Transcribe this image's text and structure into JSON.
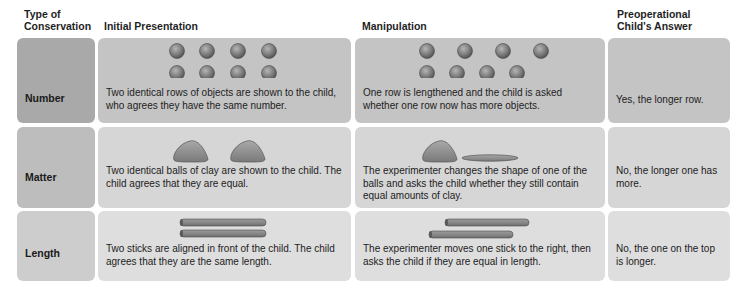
{
  "headers": {
    "type": [
      "Type of",
      "Conservation"
    ],
    "initial": "Initial Presentation",
    "manipulation": "Manipulation",
    "answer": [
      "Preoperational",
      "Child's Answer"
    ]
  },
  "rows": [
    {
      "type": "Number",
      "initial": "Two identical rows of objects are shown to the child, who agrees they have the same number.",
      "manipulation": "One row is lengthened and the child is asked whether one row now has more objects.",
      "answer": "Yes, the longer row.",
      "initial_illustration": "two-rows-of-four-balls-icon",
      "manipulation_illustration": "lengthened-row-of-balls-icon"
    },
    {
      "type": "Matter",
      "initial": "Two identical balls of clay are shown to the child. The child agrees that they are equal.",
      "manipulation": "The experimenter changes the shape of one of the balls and asks the child whether they still contain equal amounts of clay.",
      "answer": "No, the longer one has more.",
      "initial_illustration": "two-clay-balls-icon",
      "manipulation_illustration": "clay-ball-and-flattened-clay-icon"
    },
    {
      "type": "Length",
      "initial": "Two sticks are aligned in front of the child. The child agrees that they are the same length.",
      "manipulation": "The experimenter moves one stick to the right, then asks the child if they are equal in length.",
      "answer": "No, the one on the top is longer.",
      "initial_illustration": "two-aligned-sticks-icon",
      "manipulation_illustration": "offset-sticks-icon"
    }
  ]
}
